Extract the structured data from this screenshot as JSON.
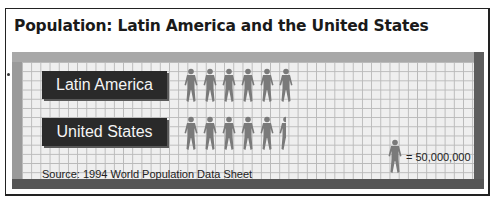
{
  "title": "Population: Latin America and the United States",
  "chart_data": {
    "type": "pictograph",
    "title": "Population: Latin America and the United States",
    "categories": [
      "Latin America",
      "United States"
    ],
    "values": [
      300000000,
      262500000
    ],
    "icon_counts": [
      6,
      5.25
    ],
    "unit_per_icon": 50000000,
    "legend": "= 50,000,000",
    "source": "Source: 1994 World Population Data Sheet",
    "grid": true
  },
  "rows": [
    {
      "label": "Latin America",
      "full_icons": 6,
      "partial_fraction": 0
    },
    {
      "label": "United States",
      "full_icons": 5,
      "partial_fraction": 0.3
    }
  ],
  "legend": {
    "icon": "person-icon",
    "text": "= 50,000,000"
  },
  "source": "Source: 1994 World Population Data Sheet",
  "colors": {
    "icon": "#7a7a7a",
    "label_bg": "#2a2a2a",
    "grid_bg": "#efefef",
    "grid_line": "#b9b9b9"
  }
}
